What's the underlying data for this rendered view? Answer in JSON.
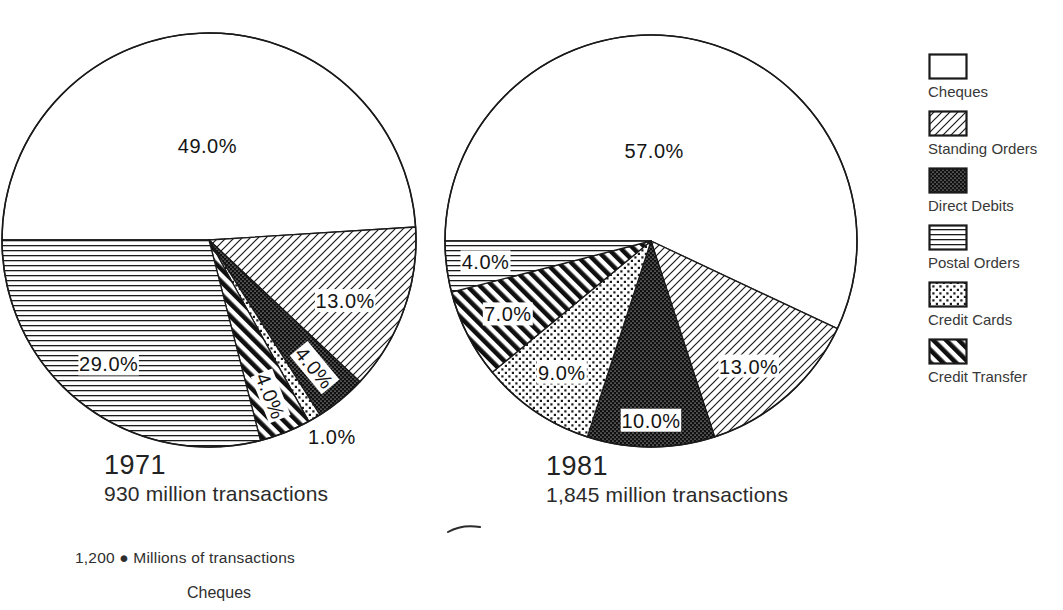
{
  "chart_data": {
    "type": "pie",
    "title": "",
    "direction": "clockwise",
    "start_angle": "9 o'clock",
    "legend_position": "right",
    "legend": [
      {
        "label": "Cheques",
        "pattern": "plain"
      },
      {
        "label": "Standing Orders",
        "pattern": "diagonal-hatch-thin"
      },
      {
        "label": "Direct Debits",
        "pattern": "black-dense-dots"
      },
      {
        "label": "Postal Orders",
        "pattern": "horizontal-lines"
      },
      {
        "label": "Credit Cards",
        "pattern": "dots"
      },
      {
        "label": "Credit Transfer",
        "pattern": "diagonal-stripes-bold"
      }
    ],
    "pies": [
      {
        "year": "1971",
        "caption": "930 million transactions",
        "slices": [
          {
            "label": "Cheques",
            "value": 49.0,
            "text": "49.0%"
          },
          {
            "label": "Standing Orders",
            "value": 13.0,
            "text": "13.0%"
          },
          {
            "label": "Direct Debits",
            "value": 4.0,
            "text": "4.0%"
          },
          {
            "label": "Credit Cards",
            "value": 1.0,
            "text": "1.0%"
          },
          {
            "label": "Credit Transfer",
            "value": 4.0,
            "text": "4.0%"
          },
          {
            "label": "Postal Orders",
            "value": 29.0,
            "text": "29.0%"
          }
        ]
      },
      {
        "year": "1981",
        "caption": "1,845 million transactions",
        "slices": [
          {
            "label": "Cheques",
            "value": 57.0,
            "text": "57.0%"
          },
          {
            "label": "Standing Orders",
            "value": 13.0,
            "text": "13.0%"
          },
          {
            "label": "Direct Debits",
            "value": 10.0,
            "text": "10.0%"
          },
          {
            "label": "Credit Cards",
            "value": 9.0,
            "text": "9.0%"
          },
          {
            "label": "Credit Transfer",
            "value": 7.0,
            "text": "7.0%"
          },
          {
            "label": "Postal Orders",
            "value": 4.0,
            "text": "4.0%"
          }
        ]
      }
    ]
  },
  "footer": {
    "axis_note": "1,200 ● Millions of transactions",
    "category": "Cheques"
  },
  "colors": {
    "ink": "#1a1a1a",
    "paper": "#ffffff"
  }
}
